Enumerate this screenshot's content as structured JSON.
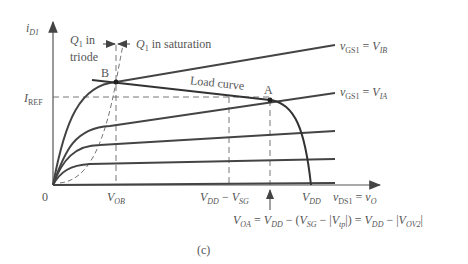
{
  "figure": {
    "caption": "(c)",
    "y_axis": {
      "symbol": "i",
      "subscript": "D1"
    },
    "x_axis": {
      "lhs": "v",
      "lhs_sub": "DS1",
      "eq": " = ",
      "rhs": "v",
      "rhs_sub": "O"
    },
    "origin": "0",
    "i_ref": {
      "symbol": "I",
      "subscript": "REF"
    },
    "region_labels": {
      "triode": {
        "q": "Q",
        "q_sub": "1",
        "line1": " in",
        "line2": "triode"
      },
      "saturation": {
        "q": "Q",
        "q_sub": "1",
        "text": " in saturation"
      }
    },
    "points": {
      "A": "A",
      "B": "B"
    },
    "load_curve_label": "Load curve",
    "curve_labels": {
      "vgs_b": {
        "lhs": "v",
        "lhs_sub": "GS1",
        "eq": " = ",
        "rhs": "V",
        "rhs_sub": "IB"
      },
      "vgs_a": {
        "lhs": "v",
        "lhs_sub": "GS1",
        "eq": " = ",
        "rhs": "V",
        "rhs_sub": "IA"
      }
    },
    "x_ticks": {
      "vob": {
        "symbol": "V",
        "sub": "OB"
      },
      "vdd_minus_vsg": {
        "a": "V",
        "a_sub": "DD",
        "minus": " − ",
        "b": "V",
        "b_sub": "SG"
      },
      "vdd": {
        "symbol": "V",
        "sub": "DD"
      }
    },
    "voa_equation": {
      "t1": "V",
      "t1_sub": "OA",
      "t2": " = ",
      "t3": "V",
      "t3_sub": "DD",
      "t4": " − (",
      "t5": "V",
      "t5_sub": "SG",
      "t6": " − |",
      "t7": "V",
      "t7_sub": "tp",
      "t8": "|) = ",
      "t9": "V",
      "t9_sub": "DD",
      "t10": " − |",
      "t11": "V",
      "t11_sub": "OV2",
      "t12": "|"
    },
    "colors": {
      "curve": "#444444",
      "dashed": "#666666",
      "text": "#555555"
    }
  }
}
